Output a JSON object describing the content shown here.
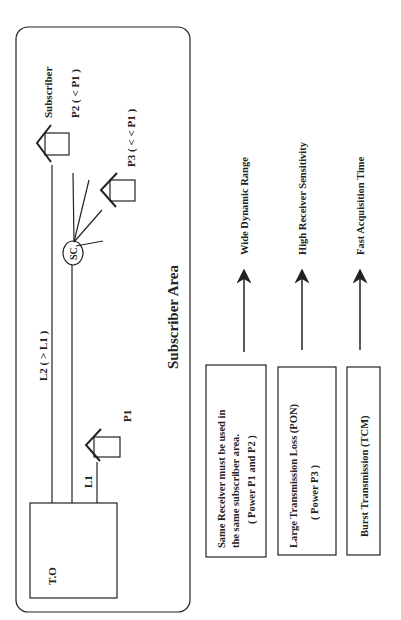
{
  "diagram": {
    "orientation": "rotated-90-ccw",
    "area_label": "Subscriber Area",
    "office_label": "T.O",
    "splitter_label": "SC",
    "lines": {
      "l1": "L1",
      "l2": "L2 ( > L1 )"
    },
    "subscribers": {
      "header": "Subscriber",
      "p1": "P1",
      "p2": "P2  ( < P1 )",
      "p3": "P3  ( < < P1 )"
    },
    "conditions": [
      {
        "line1": "Same  Receiver must be used in",
        "line2": "the same subscriber area.",
        "line3": "( Power P1 and P2 )",
        "result": "Wide  Dynamic  Range"
      },
      {
        "line1": "Large  Transmission  Loss  (PON)",
        "line2": "( Power P3 )",
        "result": "High  Receiver  Sensitivity"
      },
      {
        "line1": "Burst  Transmission  (TCM)",
        "result": "Fast  Acquisition  Time"
      }
    ],
    "colors": {
      "ink": "#222222",
      "background": "#ffffff"
    }
  }
}
